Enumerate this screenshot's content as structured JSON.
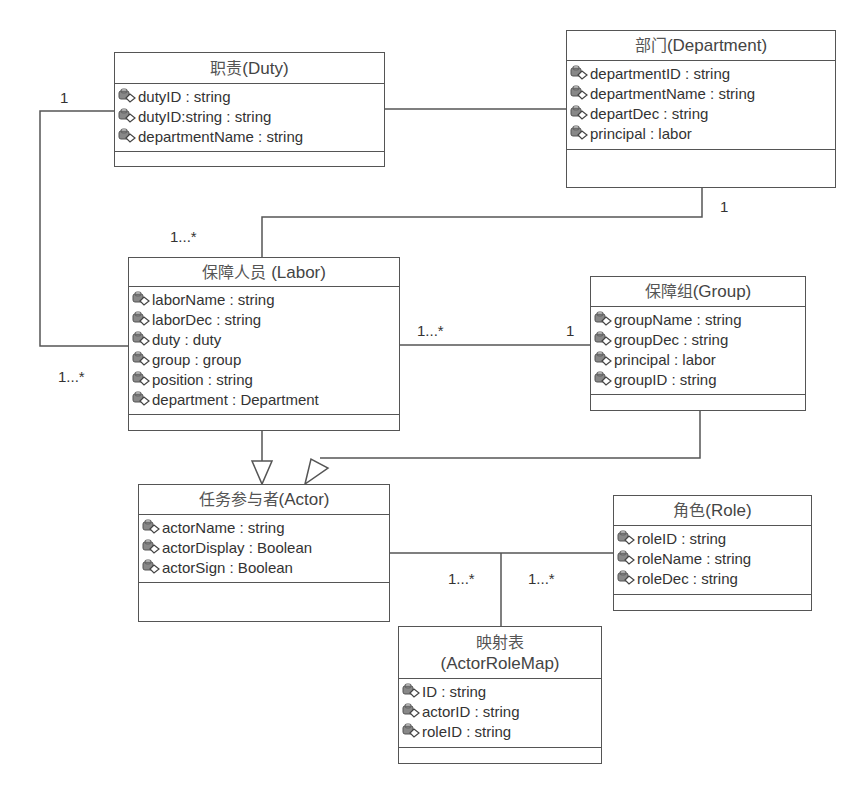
{
  "classes": {
    "duty": {
      "title_cn": "职责",
      "title_en": "(Duty)",
      "attributes": [
        "dutyID : string",
        "dutyID:string : string",
        "departmentName : string"
      ]
    },
    "department": {
      "title_cn": "部门",
      "title_en": "(Department)",
      "attributes": [
        "departmentID : string",
        "departmentName : string",
        "departDec : string",
        "principal : labor"
      ]
    },
    "labor": {
      "title_cn": "保障人员 ",
      "title_en": "(Labor)",
      "attributes": [
        "laborName : string",
        "laborDec : string",
        "duty : duty",
        "group : group",
        "position : string",
        "department : Department"
      ]
    },
    "group": {
      "title_cn": "保障组",
      "title_en": "(Group)",
      "attributes": [
        "groupName : string",
        "groupDec : string",
        "principal : labor",
        "groupID : string"
      ]
    },
    "actor": {
      "title_cn": "任务参与者",
      "title_en": "(Actor)",
      "attributes": [
        "actorName : string",
        "actorDisplay : Boolean",
        "actorSign : Boolean"
      ]
    },
    "role": {
      "title_cn": "角色",
      "title_en": "(Role)",
      "attributes": [
        "roleID : string",
        "roleName : string",
        "roleDec : string"
      ]
    },
    "actorrolemap": {
      "title_cn": "映射表",
      "title_en": "(ActorRoleMap)",
      "attributes": [
        "ID : string",
        "actorID : string",
        "roleID : string"
      ]
    }
  },
  "multiplicities": {
    "duty_labor_duty_end": "1",
    "duty_labor_labor_end": "1...*",
    "dept_labor_dept_end": "1",
    "dept_labor_labor_end": "1...*",
    "labor_group_labor_end": "1...*",
    "labor_group_group_end": "1",
    "actor_map_end": "1...*",
    "role_map_end": "1...*"
  },
  "colors": {
    "line": "#555555",
    "text": "#333333",
    "background": "#ffffff"
  }
}
